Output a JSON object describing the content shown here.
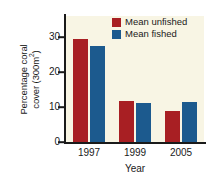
{
  "chart_data": {
    "type": "bar",
    "title": "",
    "subtitle": "",
    "categories": [
      "1997",
      "1999",
      "2005"
    ],
    "series": [
      {
        "name": "Mean unfished",
        "color": "#a81f23",
        "values": [
          29.5,
          11.7,
          8.8
        ]
      },
      {
        "name": "Mean fished",
        "color": "#1c5a8e",
        "values": [
          27.5,
          11.2,
          11.5
        ]
      }
    ],
    "xlabel": "Year",
    "ylabel_line1": "Percentage coral",
    "ylabel_line2_pre": "cover (300m",
    "ylabel_line2_sup": "2",
    "ylabel_line2_post": ")",
    "yticks": [
      0,
      10,
      20,
      30
    ],
    "ytick_labels": [
      "0",
      "10",
      "20",
      "30"
    ],
    "ylim": [
      0,
      36
    ],
    "grid": false,
    "legend_position": "top-right-inside",
    "plot_background": "#f8f5e4",
    "figure_background": "#ffffff",
    "axis_color": "#1a1a1a"
  }
}
